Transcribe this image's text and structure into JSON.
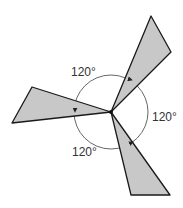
{
  "diagram": {
    "labels": {
      "angle_top": "120°",
      "angle_right": "120°",
      "angle_bottom": "120°"
    },
    "colors": {
      "blade_fill": "#c8c8c8",
      "blade_stroke": "#1a1a1a",
      "circle_stroke": "#555555",
      "text": "#333333"
    }
  }
}
